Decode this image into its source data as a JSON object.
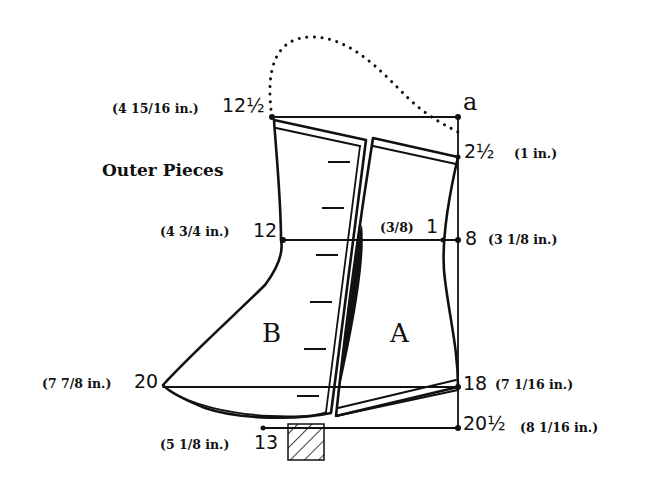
{
  "diagram": {
    "title": "Outer Pieces",
    "pieces": {
      "left": "B",
      "right": "A"
    },
    "corner_label": "a",
    "points": {
      "top_left": {
        "number": "12½",
        "measurement": "(4 15/16 in.)"
      },
      "top_right": {
        "number": "2½",
        "measurement": "(1 in.)"
      },
      "mid_left": {
        "number": "12",
        "measurement": "(4 3/4 in.)"
      },
      "mid_center": {
        "number": "1",
        "measurement": "(3/8)"
      },
      "mid_right": {
        "number": "8",
        "measurement": "(3 1/8 in.)"
      },
      "low_left": {
        "number": "20",
        "measurement": "(7 7/8 in.)"
      },
      "low_right": {
        "number": "18",
        "measurement": "(7 1/16 in.)"
      },
      "bottom_center": {
        "number": "13",
        "measurement": "(5 1/8 in.)"
      },
      "bottom_right": {
        "number": "20½",
        "measurement": "(8 1/16 in.)"
      }
    },
    "colors": {
      "ink": "#111111",
      "paper": "#ffffff"
    }
  }
}
